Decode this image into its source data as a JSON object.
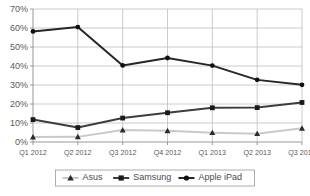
{
  "chart_data": {
    "type": "line",
    "title": "",
    "xlabel": "",
    "ylabel": "",
    "categories": [
      "Q1 2012",
      "Q2 2012",
      "Q3 2012",
      "Q4 2012",
      "Q1 2013",
      "Q2 2013",
      "Q3 2013"
    ],
    "ylim": [
      0,
      70
    ],
    "ytick_labels": [
      "70%",
      "60%",
      "50%",
      "40%",
      "30%",
      "20%",
      "10%",
      "0%"
    ],
    "ytick_values": [
      70,
      60,
      50,
      40,
      30,
      20,
      10,
      0
    ],
    "grid": true,
    "legend_position": "bottom",
    "series": [
      {
        "name": "Asus",
        "values": [
          2.6,
          2.7,
          6.3,
          5.9,
          4.9,
          4.4,
          7.2
        ],
        "color": "#c9c9c9",
        "marker": "triangle",
        "marker_color": "#2b2b2b"
      },
      {
        "name": "Samsung",
        "values": [
          11.8,
          7.6,
          12.6,
          15.4,
          18.0,
          18.1,
          20.8
        ],
        "color": "#3d3d3d",
        "marker": "square",
        "marker_color": "#1a1a1a"
      },
      {
        "name": "Apple iPad",
        "values": [
          58.2,
          60.5,
          40.3,
          44.2,
          40.2,
          32.7,
          30.1
        ],
        "color": "#262626",
        "marker": "circle",
        "marker_color": "#111111"
      }
    ]
  },
  "legend": {
    "items": [
      {
        "label": "Asus"
      },
      {
        "label": "Samsung"
      },
      {
        "label": "Apple iPad"
      }
    ]
  },
  "axes": {
    "y_labels": [
      "70%",
      "60%",
      "50%",
      "40%",
      "30%",
      "20%",
      "10%",
      "0%"
    ],
    "x_labels": [
      "Q1 2012",
      "Q2 2012",
      "Q3 2012",
      "Q4 2012",
      "Q1 2013",
      "Q2 2013",
      "Q3 2013"
    ]
  }
}
